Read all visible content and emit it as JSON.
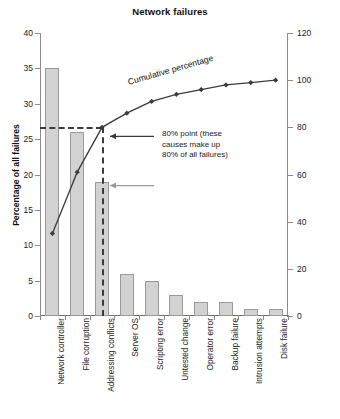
{
  "chart_data": {
    "type": "bar",
    "title": "Network failures",
    "xlabel": "",
    "ylabel": "Percentage of all failures",
    "y2label": "Total percentage",
    "ylim": [
      0,
      40
    ],
    "y2lim": [
      0,
      120
    ],
    "yticks": [
      0,
      5,
      10,
      15,
      20,
      25,
      30,
      35,
      40
    ],
    "y2ticks": [
      0,
      20,
      40,
      60,
      80,
      100,
      120
    ],
    "grid": false,
    "legend": "none",
    "categories": [
      "Network controller",
      "File corruption",
      "Addressing conflicts",
      "Server OS",
      "Scripting error",
      "Untested change",
      "Operator error",
      "Backup failure",
      "Intrusion attempts",
      "Disk failure"
    ],
    "series": [
      {
        "name": "Percentage of all failures",
        "type": "bar",
        "axis": "left",
        "values": [
          35,
          26,
          19,
          6,
          5,
          3,
          2,
          2,
          1,
          1
        ]
      },
      {
        "name": "Cumulative percentage",
        "type": "line",
        "axis": "right",
        "values": [
          35,
          61,
          80,
          86,
          91,
          94,
          96,
          98,
          99,
          100
        ]
      }
    ],
    "annotations": [
      {
        "name": "cumulative-line-label",
        "text": "Cumulative percentage"
      },
      {
        "name": "eighty-percent-callout",
        "lines": [
          "80% point (these",
          "causes make up",
          "80% of all failures)"
        ]
      }
    ],
    "reference_lines": [
      {
        "name": "eighty-percent-horizontal",
        "axis": "right",
        "value": 80
      },
      {
        "name": "eighty-percent-vertical",
        "category": "Addressing conflicts"
      }
    ]
  },
  "colors": {
    "bar_fill": "#d2d2d2",
    "bar_stroke": "#9a9a9a",
    "line": "#3c3c3c",
    "dashed": "#3a3a3a",
    "axis": "#8c8c8c",
    "text": "#1a1a1a"
  }
}
